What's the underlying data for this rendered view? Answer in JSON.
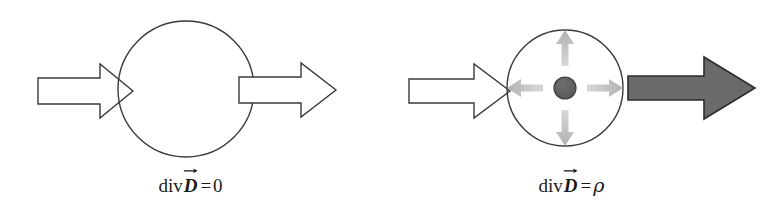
{
  "figure": {
    "background_color": "#ffffff",
    "panels": [
      {
        "id": "divergence-free",
        "caption": {
          "operator": "div",
          "vector_symbol": "D",
          "vector_accent": "arrow",
          "equals": "=",
          "right_hand_side": "0",
          "full_text": "div D⃗ = 0"
        },
        "circle": {
          "cx": 186,
          "cy": 89,
          "r": 68,
          "stroke": "#3a3a3a",
          "fill": "#ffffff"
        },
        "arrow_in": {
          "label": "incoming-flux-arrow",
          "style": "hollow",
          "fill": "#ffffff",
          "stroke": "#3a3a3a",
          "direction": "right"
        },
        "arrow_out": {
          "label": "outgoing-flux-arrow",
          "style": "hollow",
          "fill": "#ffffff",
          "stroke": "#3a3a3a",
          "direction": "right"
        },
        "charge": null,
        "radial_arrows": []
      },
      {
        "id": "divergence-with-charge",
        "caption": {
          "operator": "div",
          "vector_symbol": "D",
          "vector_accent": "arrow",
          "equals": "=",
          "right_hand_side": "ρ",
          "full_text": "div D⃗ = ρ"
        },
        "circle": {
          "cx": 184,
          "cy": 88,
          "r": 58,
          "stroke": "#3a3a3a",
          "fill": "#ffffff"
        },
        "arrow_in": {
          "label": "incoming-flux-arrow",
          "style": "hollow",
          "fill": "#ffffff",
          "stroke": "#3a3a3a",
          "direction": "right"
        },
        "arrow_out": {
          "label": "outgoing-flux-arrow",
          "style": "filled",
          "fill": "#6a6a6a",
          "stroke": "#2b2b2b",
          "direction": "right"
        },
        "charge": {
          "label": "point-charge",
          "cx": 184,
          "cy": 88,
          "r": 11,
          "fill": "#5c5c5c",
          "stroke": "#3d3d3d"
        },
        "radial_arrows": [
          {
            "direction": "up",
            "color": "#b9b9b9"
          },
          {
            "direction": "right",
            "color": "#b9b9b9"
          },
          {
            "direction": "down",
            "color": "#b9b9b9"
          },
          {
            "direction": "left",
            "color": "#b9b9b9"
          }
        ]
      }
    ]
  }
}
